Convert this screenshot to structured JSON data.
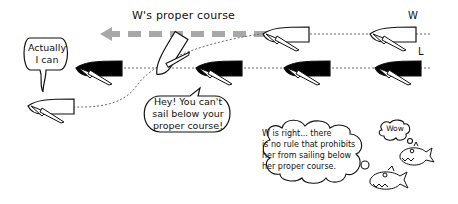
{
  "diagram": {
    "course_label": "W's proper course",
    "boat_labels": {
      "windward": "W",
      "leeward": "L"
    },
    "speech": {
      "leeward_boat": "Actually\nI can",
      "windward_boat": "Hey! You can't\nsail below your\nproper course!",
      "narrator_thought": "W is right... there\nis no rule that prohibits\nher from sailing below\nher proper course.",
      "fish": "Wow"
    },
    "colors": {
      "ink": "#111111",
      "arrow": "#a8a8a8",
      "windward_hull": "#ffffff",
      "leeward_hull": "#000000"
    }
  }
}
